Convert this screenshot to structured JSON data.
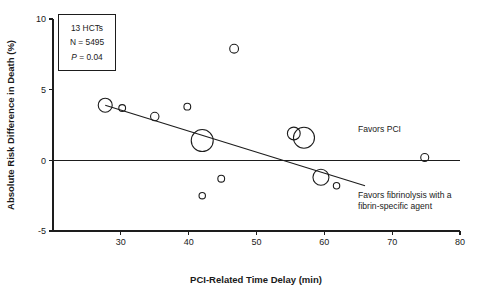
{
  "stats_box": {
    "trials": "13 HCTs",
    "n": "N = 5495",
    "p_italic": "P",
    "p_rest": " = 0.04"
  },
  "annotations": {
    "favors_pci": "Favors PCI",
    "favors_fibrinolysis_line1": "Favors fibrinolysis with a",
    "favors_fibrinolysis_line2": "fibrin-specific agent"
  },
  "chart_data": {
    "type": "scatter",
    "title": "",
    "xlabel": "PCI-Related Time Delay (min)",
    "ylabel": "Absolute Risk Difference in Death (%)",
    "xlim": [
      20,
      80
    ],
    "ylim": [
      -5,
      10
    ],
    "xticks": [
      30,
      40,
      50,
      60,
      70,
      80
    ],
    "xticklabels": [
      "30",
      "40",
      "50",
      "60",
      "70",
      "80"
    ],
    "yticks": [
      -5,
      0,
      5,
      10
    ],
    "yticklabels": [
      "-5",
      "0",
      "5",
      "10"
    ],
    "grid": false,
    "legend": "none",
    "zero_reference_line": {
      "y": 0,
      "x_start": 20,
      "x_end": 80
    },
    "trend_line": {
      "x_start": 27.7,
      "y_start": 3.9,
      "x_end": 66.0,
      "y_end": -1.8
    },
    "points": [
      {
        "x": 27.7,
        "y": 3.9,
        "size": 7.0
      },
      {
        "x": 30.2,
        "y": 3.7,
        "size": 3.4
      },
      {
        "x": 35.0,
        "y": 3.1,
        "size": 4.2
      },
      {
        "x": 39.8,
        "y": 3.8,
        "size": 3.4
      },
      {
        "x": 42.0,
        "y": 1.4,
        "size": 11.0
      },
      {
        "x": 42.0,
        "y": -2.5,
        "size": 3.2
      },
      {
        "x": 44.8,
        "y": -1.3,
        "size": 3.4
      },
      {
        "x": 46.7,
        "y": 7.9,
        "size": 4.4
      },
      {
        "x": 55.5,
        "y": 1.9,
        "size": 6.4
      },
      {
        "x": 57.0,
        "y": 1.6,
        "size": 10.5
      },
      {
        "x": 59.5,
        "y": -1.2,
        "size": 8.0
      },
      {
        "x": 61.8,
        "y": -1.8,
        "size": 3.2
      },
      {
        "x": 74.8,
        "y": 0.2,
        "size": 4.0
      }
    ]
  }
}
